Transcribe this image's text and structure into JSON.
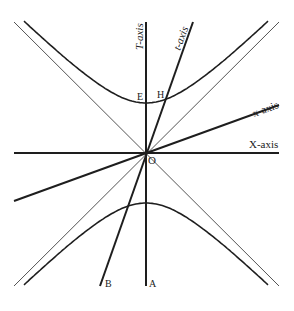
{
  "diagram": {
    "labels": {
      "T_axis": "T-axis",
      "t_axis": "t-axis",
      "x_axis": "x-axis",
      "X_axis": "X-axis",
      "origin": "O",
      "point_E": "E",
      "point_H": "H",
      "point_A": "A",
      "point_B": "B"
    },
    "colors": {
      "ink": "#1e1e1e",
      "asymptote": "#555555",
      "background": "#ffffff"
    },
    "frame_velocity_fraction_of_c": 0.36,
    "hyperbola_invariant_interval": 1
  }
}
